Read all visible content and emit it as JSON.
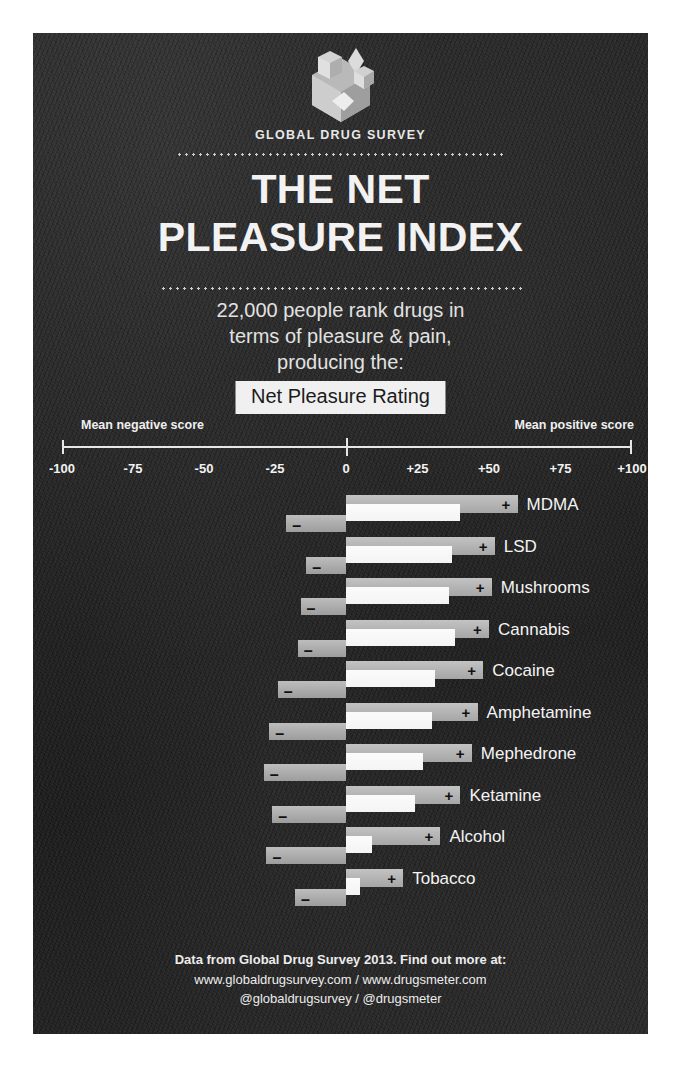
{
  "brand": {
    "name": "GLOBAL DRUG SURVEY",
    "logo_icon": "hexagon-cubes-logo-icon"
  },
  "title": {
    "line1": "THE NET",
    "line2": "PLEASURE INDEX"
  },
  "subtitle": {
    "line1": "22,000 people rank drugs in",
    "line2": "terms of pleasure & pain,",
    "line3": "producing the:"
  },
  "rating_chip": "Net Pleasure Rating",
  "axis": {
    "negative_label": "Mean negative score",
    "positive_label": "Mean positive score",
    "ticks": [
      "-100",
      "-75",
      "-50",
      "-25",
      "0",
      "+25",
      "+50",
      "+75",
      "+100"
    ]
  },
  "markers": {
    "positive": "+",
    "negative": "–"
  },
  "footer": {
    "line1": "Data from Global Drug Survey 2013.  Find out more at:",
    "line2": "www.globaldrugsurvey.com  /  www.drugsmeter.com",
    "line3": "@globaldrugsurvey  /  @drugsmeter"
  },
  "colors": {
    "background": "#ffffff",
    "panel": "#252525",
    "net_bar": "#b4b4b4",
    "positive_bar": "#f7f7f7",
    "negative_bar": "#aeaeae",
    "text": "#f2f2f2"
  },
  "chart_data": {
    "type": "bar",
    "title": "THE NET PLEASURE INDEX",
    "subtitle": "22,000 people rank drugs in terms of pleasure & pain, producing the: Net Pleasure Rating",
    "xlabel": "Net Pleasure Rating",
    "ylabel": "",
    "xlim": [
      -100,
      100
    ],
    "xticks": [
      -100,
      -75,
      -50,
      -25,
      0,
      25,
      50,
      75,
      100
    ],
    "grid": false,
    "legend": "none",
    "orientation": "horizontal",
    "categories": [
      "MDMA",
      "LSD",
      "Mushrooms",
      "Cannabis",
      "Cocaine",
      "Amphetamine",
      "Mephedrone",
      "Ketamine",
      "Alcohol",
      "Tobacco"
    ],
    "series": [
      {
        "name": "Net pleasure score",
        "values": [
          60,
          52,
          51,
          50,
          48,
          46,
          44,
          40,
          33,
          20
        ]
      },
      {
        "name": "Mean positive score",
        "values": [
          40,
          37,
          36,
          38,
          31,
          30,
          27,
          24,
          9,
          5
        ]
      },
      {
        "name": "Mean negative score",
        "values": [
          -21,
          -14,
          -16,
          -17,
          -24,
          -27,
          -29,
          -26,
          -28,
          -18
        ]
      }
    ]
  }
}
